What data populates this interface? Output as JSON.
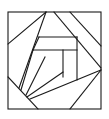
{
  "diagram": {
    "type": "geometric-line-figure",
    "stroke_color": "#1a1a1a",
    "background_color": "#ffffff",
    "outer_square": {
      "x": 8,
      "y": 12,
      "width": 93,
      "height": 97
    },
    "segments": [
      {
        "name": "apex-to-left-edge",
        "x1": 46,
        "y1": 12,
        "x2": 8,
        "y2": 44
      },
      {
        "name": "apex-to-lower-left-fan",
        "x1": 46,
        "y1": 12,
        "x2": 19,
        "y2": 88
      },
      {
        "name": "top-diagonal-inner",
        "x1": 54,
        "y1": 12,
        "x2": 101,
        "y2": 68
      },
      {
        "name": "top-diagonal-outer",
        "x1": 70,
        "y1": 12,
        "x2": 101,
        "y2": 46
      },
      {
        "name": "upper-bar-top",
        "x1": 39,
        "y1": 37,
        "x2": 77,
        "y2": 37
      },
      {
        "name": "upper-bar-left-slant",
        "x1": 39,
        "y1": 37,
        "x2": 33,
        "y2": 50
      },
      {
        "name": "lower-bar",
        "x1": 33,
        "y1": 50,
        "x2": 77,
        "y2": 50
      },
      {
        "name": "lower-bar-left-to-fan",
        "x1": 33,
        "y1": 50,
        "x2": 21,
        "y2": 90
      },
      {
        "name": "fan-line-middle",
        "x1": 45,
        "y1": 57,
        "x2": 26,
        "y2": 95
      },
      {
        "name": "inner-vertical-left",
        "x1": 63,
        "y1": 50,
        "x2": 63,
        "y2": 77
      },
      {
        "name": "inner-vertical-right",
        "x1": 77,
        "y1": 37,
        "x2": 77,
        "y2": 80
      },
      {
        "name": "fan-to-inner-vertical-left",
        "x1": 27,
        "y1": 97,
        "x2": 63,
        "y2": 72
      },
      {
        "name": "long-diagonal-to-right-edge",
        "x1": 30,
        "y1": 99,
        "x2": 101,
        "y2": 70
      },
      {
        "name": "left-edge-to-bottom",
        "x1": 8,
        "y1": 77,
        "x2": 38,
        "y2": 109
      },
      {
        "name": "right-edge-to-bottom",
        "x1": 101,
        "y1": 70,
        "x2": 70,
        "y2": 109
      }
    ]
  }
}
